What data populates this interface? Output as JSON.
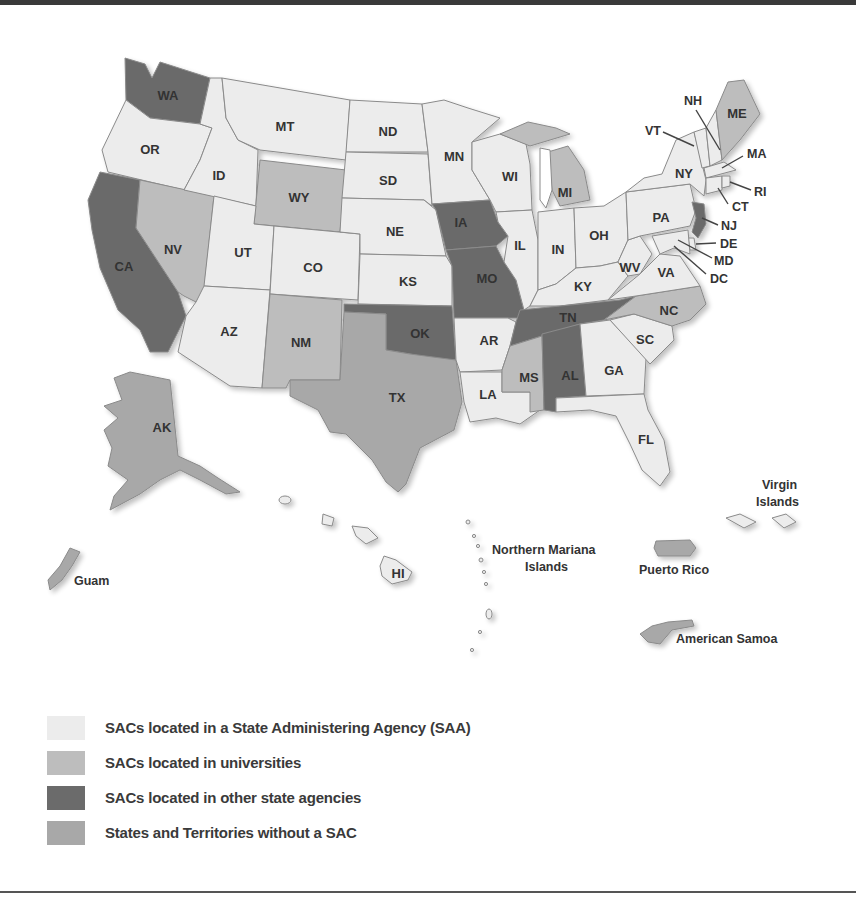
{
  "colors": {
    "saa": "#ececec",
    "universities": "#bdbdbd",
    "other_agencies": "#6b6b6b",
    "no_sac": "#a8a8a8",
    "border": "#8a8a8a"
  },
  "legend": [
    {
      "key": "saa",
      "label": "SACs located in a State Administering Agency (SAA)",
      "color": "#ececec"
    },
    {
      "key": "universities",
      "label": "SACs located in universities",
      "color": "#bdbdbd"
    },
    {
      "key": "other_agencies",
      "label": "SACs located in other state agencies",
      "color": "#6b6b6b"
    },
    {
      "key": "no_sac",
      "label": "States and Territories without a SAC",
      "color": "#a8a8a8"
    }
  ],
  "states": {
    "WA": {
      "label": "WA",
      "category": "other_agencies"
    },
    "OR": {
      "label": "OR",
      "category": "saa"
    },
    "CA": {
      "label": "CA",
      "category": "other_agencies"
    },
    "NV": {
      "label": "NV",
      "category": "universities"
    },
    "ID": {
      "label": "ID",
      "category": "saa"
    },
    "MT": {
      "label": "MT",
      "category": "saa"
    },
    "WY": {
      "label": "WY",
      "category": "universities"
    },
    "UT": {
      "label": "UT",
      "category": "saa"
    },
    "AZ": {
      "label": "AZ",
      "category": "saa"
    },
    "CO": {
      "label": "CO",
      "category": "saa"
    },
    "NM": {
      "label": "NM",
      "category": "universities"
    },
    "ND": {
      "label": "ND",
      "category": "saa"
    },
    "SD": {
      "label": "SD",
      "category": "saa"
    },
    "NE": {
      "label": "NE",
      "category": "saa"
    },
    "KS": {
      "label": "KS",
      "category": "saa"
    },
    "OK": {
      "label": "OK",
      "category": "other_agencies"
    },
    "TX": {
      "label": "TX",
      "category": "no_sac"
    },
    "MN": {
      "label": "MN",
      "category": "saa"
    },
    "IA": {
      "label": "IA",
      "category": "other_agencies"
    },
    "MO": {
      "label": "MO",
      "category": "other_agencies"
    },
    "AR": {
      "label": "AR",
      "category": "saa"
    },
    "LA": {
      "label": "LA",
      "category": "saa"
    },
    "WI": {
      "label": "WI",
      "category": "saa"
    },
    "IL": {
      "label": "IL",
      "category": "saa"
    },
    "MI": {
      "label": "MI",
      "category": "universities"
    },
    "IN": {
      "label": "IN",
      "category": "saa"
    },
    "OH": {
      "label": "OH",
      "category": "saa"
    },
    "KY": {
      "label": "KY",
      "category": "saa"
    },
    "TN": {
      "label": "TN",
      "category": "other_agencies"
    },
    "MS": {
      "label": "MS",
      "category": "universities"
    },
    "AL": {
      "label": "AL",
      "category": "other_agencies"
    },
    "GA": {
      "label": "GA",
      "category": "saa"
    },
    "FL": {
      "label": "FL",
      "category": "saa"
    },
    "SC": {
      "label": "SC",
      "category": "saa"
    },
    "NC": {
      "label": "NC",
      "category": "universities"
    },
    "VA": {
      "label": "VA",
      "category": "saa"
    },
    "WV": {
      "label": "WV",
      "category": "saa"
    },
    "PA": {
      "label": "PA",
      "category": "saa"
    },
    "NY": {
      "label": "NY",
      "category": "saa"
    },
    "VT": {
      "label": "VT",
      "category": "saa"
    },
    "NH": {
      "label": "NH",
      "category": "saa"
    },
    "ME": {
      "label": "ME",
      "category": "universities"
    },
    "MA": {
      "label": "MA",
      "category": "saa"
    },
    "RI": {
      "label": "RI",
      "category": "saa"
    },
    "CT": {
      "label": "CT",
      "category": "saa"
    },
    "NJ": {
      "label": "NJ",
      "category": "other_agencies"
    },
    "DE": {
      "label": "DE",
      "category": "saa"
    },
    "MD": {
      "label": "MD",
      "category": "saa"
    },
    "DC": {
      "label": "DC",
      "category": "saa"
    },
    "AK": {
      "label": "AK",
      "category": "no_sac"
    },
    "HI": {
      "label": "HI",
      "category": "saa"
    }
  },
  "territories": {
    "guam": {
      "label": "Guam",
      "category": "no_sac"
    },
    "northern_mariana_1": {
      "label": "Northern Mariana",
      "category": "saa"
    },
    "northern_mariana_2": {
      "label": "Islands",
      "category": "saa"
    },
    "puerto_rico": {
      "label": "Puerto Rico",
      "category": "no_sac"
    },
    "virgin_1": {
      "label": "Virgin",
      "category": "saa"
    },
    "virgin_2": {
      "label": "Islands",
      "category": "saa"
    },
    "american_samoa": {
      "label": "American Samoa",
      "category": "no_sac"
    }
  }
}
